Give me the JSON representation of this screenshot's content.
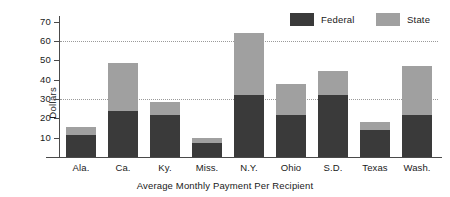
{
  "chart_data": {
    "type": "bar",
    "subtype": "stacked-vertical",
    "title": "",
    "xlabel": "Average Monthly Payment Per Recipient",
    "ylabel": "Dollars",
    "categories": [
      "Ala.",
      "Ca.",
      "Ky.",
      "Miss.",
      "N.Y.",
      "Ohio",
      "S.D.",
      "Texas",
      "Wash."
    ],
    "series": [
      {
        "name": "Federal",
        "color": "#3a3a3a",
        "values": [
          11.5,
          24,
          21.5,
          7.5,
          32,
          21.5,
          32,
          14,
          21.5
        ]
      },
      {
        "name": "State",
        "color": "#a0a0a0",
        "values": [
          4,
          24.5,
          7,
          2.5,
          32,
          16.5,
          12.5,
          4,
          25.5
        ]
      }
    ],
    "totals": [
      15.5,
      48.5,
      28.5,
      10,
      64,
      38,
      44.5,
      18,
      47
    ],
    "ylim": [
      0,
      73
    ],
    "yticks": [
      10,
      20,
      30,
      40,
      50,
      60,
      70
    ],
    "ytick_labels": [
      "10",
      "20",
      "30",
      "40",
      "50",
      "60",
      "70"
    ],
    "gridlines": [
      30,
      60
    ],
    "grid": "horizontal-dotted-at-30-and-60",
    "legend_position": "top-right",
    "legend": [
      "Federal",
      "State"
    ],
    "axis_color": "#4a4a4a",
    "grid_color": "#9a9a9a",
    "background": "#ffffff"
  }
}
